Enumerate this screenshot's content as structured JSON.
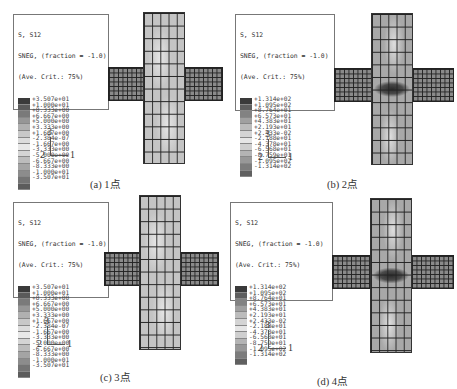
{
  "panels": [
    {
      "id": "a",
      "caption": "(a) 1点",
      "legend": {
        "title": [
          "S, S12",
          "SNEG, (fraction = -1.0)",
          "(Ave. Crit.: 75%)"
        ],
        "values": [
          "+3.507e+01",
          "+1.000e+01",
          "+8.333e+00",
          "+6.667e+00",
          "+5.000e+00",
          "+3.333e+00",
          "+1.667e+00",
          "-2.384e-07",
          "-1.667e+00",
          "-3.333e+00",
          "-5.000e+00",
          "-6.667e+00",
          "-8.333e+00",
          "-1.000e+01",
          "-3.507e+01"
        ],
        "colors": [
          "#3a3a3a",
          "#5a5a5a",
          "#7a7a7a",
          "#969696",
          "#b0b0b0",
          "#c8c8c8",
          "#dcdcdc",
          "#e8e8e8",
          "#d4d4d4",
          "#bcbcbc",
          "#a4a4a4",
          "#8c8c8c",
          "#747474",
          "#5c5c5c",
          "#404040"
        ]
      },
      "axes": {
        "up": "3",
        "left": "2",
        "right": "1"
      },
      "mesh": {
        "column_fill": "#c4c4c4",
        "arm_fill": "#8a8a8a",
        "hotspot": false
      }
    },
    {
      "id": "b",
      "caption": "(b) 2点",
      "legend": {
        "title": [
          "S, S12",
          "SNEG, (fraction = -1.0)",
          "(Ave. Crit.: 75%)"
        ],
        "values": [
          "+1.314e+02",
          "+1.095e+02",
          "+8.764e+01",
          "+6.573e+01",
          "+4.383e+01",
          "+2.193e+01",
          "+2.433e-02",
          "-2.188e+01",
          "-4.378e+01",
          "-6.568e+01",
          "-8.759e+01",
          "-1.095e+02",
          "-1.314e+02"
        ],
        "colors": [
          "#3a3a3a",
          "#5e5e5e",
          "#828282",
          "#a0a0a0",
          "#bcbcbc",
          "#d4d4d4",
          "#e6e6e6",
          "#cfcfcf",
          "#b4b4b4",
          "#989898",
          "#7c7c7c",
          "#606060",
          "#404040"
        ]
      },
      "axes": {
        "up": "3",
        "left": "2",
        "right": "1"
      },
      "mesh": {
        "column_fill": "#a8a8a8",
        "arm_fill": "#8a8a8a",
        "hotspot": true
      }
    },
    {
      "id": "c",
      "caption": "(c) 3点",
      "legend": {
        "title": [
          "S, S12",
          "SNEG, (fraction = -1.0)",
          "(Ave. Crit.: 75%)"
        ],
        "values": [
          "+3.507e+01",
          "+1.000e+01",
          "+8.333e+00",
          "+6.667e+00",
          "+5.000e+00",
          "+3.333e+00",
          "+1.667e+00",
          "-2.384e-07",
          "-1.667e+00",
          "-3.333e+00",
          "-5.000e+00",
          "-6.667e+00",
          "-8.333e+00",
          "-1.000e+01",
          "-3.507e+01"
        ],
        "colors": [
          "#3a3a3a",
          "#5a5a5a",
          "#7a7a7a",
          "#969696",
          "#b0b0b0",
          "#c8c8c8",
          "#dcdcdc",
          "#e8e8e8",
          "#d4d4d4",
          "#bcbcbc",
          "#a4a4a4",
          "#8c8c8c",
          "#747474",
          "#5c5c5c",
          "#404040"
        ]
      },
      "axes": {
        "up": "3",
        "left": "2",
        "right": "1"
      },
      "mesh": {
        "column_fill": "#c4c4c4",
        "arm_fill": "#8a8a8a",
        "hotspot": false
      }
    },
    {
      "id": "d",
      "caption": "(d) 4点",
      "legend": {
        "title": [
          "S, S12",
          "SNEG, (fraction = -1.0)",
          "(Ave. Crit.: 75%)"
        ],
        "values": [
          "+1.314e+02",
          "+1.095e+02",
          "+8.764e+01",
          "+6.573e+01",
          "+4.383e+01",
          "+2.193e+01",
          "+2.433e-02",
          "-2.188e+01",
          "-4.378e+01",
          "-6.568e+01",
          "-8.759e+01",
          "-1.095e+02",
          "-1.314e+02"
        ],
        "colors": [
          "#3a3a3a",
          "#5e5e5e",
          "#828282",
          "#a0a0a0",
          "#bcbcbc",
          "#d4d4d4",
          "#e6e6e6",
          "#cfcfcf",
          "#b4b4b4",
          "#989898",
          "#7c7c7c",
          "#606060",
          "#404040"
        ]
      },
      "axes": {
        "up": "3",
        "left": "2",
        "right": "1"
      },
      "mesh": {
        "column_fill": "#a8a8a8",
        "arm_fill": "#8a8a8a",
        "hotspot": true
      }
    }
  ]
}
